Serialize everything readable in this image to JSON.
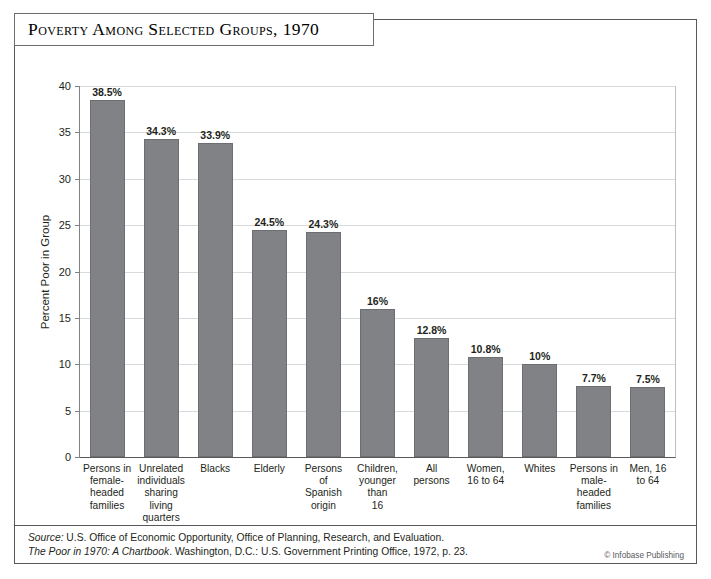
{
  "title": "Poverty Among Selected Groups, 1970",
  "footer": {
    "source_prefix": "Source:",
    "source_line1": " U.S. Office of Economic Opportunity, Office of Planning, Research, and Evaluation.",
    "source_italic_title": "The Poor in 1970: A Chartbook",
    "source_line2": ". Washington, D.C.: U.S. Government Printing Office, 1972, p. 23.",
    "credit": "© Infobase Publishing"
  },
  "colors": {
    "bar_fill": "#808285",
    "bar_edge": "#6d6e71",
    "gridline": "#d9dadb",
    "axis": "#58595b",
    "text": "#231f20",
    "frame": "#58595b"
  },
  "chart_data": {
    "type": "bar",
    "title": "Poverty Among Selected Groups, 1970",
    "xlabel": "",
    "ylabel": "Percent Poor in Group",
    "ylim": [
      0,
      40
    ],
    "yticks": [
      0,
      5,
      10,
      15,
      20,
      25,
      30,
      35,
      40
    ],
    "ytick_labels": [
      "0",
      "5",
      "10",
      "15",
      "20",
      "25",
      "30",
      "35",
      "40"
    ],
    "grid": true,
    "legend": false,
    "categories": [
      "Persons in female-headed families",
      "Unrelated individuals sharing living quarters",
      "Blacks",
      "Elderly",
      "Persons of Spanish origin",
      "Children, younger than 16",
      "All persons",
      "Women, 16 to 64",
      "Whites",
      "Persons in male-headed families",
      "Men, 16 to 64"
    ],
    "category_lines": [
      [
        "Persons in",
        "female-",
        "headed",
        "families"
      ],
      [
        "Unrelated",
        "individuals",
        "sharing",
        "living",
        "quarters"
      ],
      [
        "Blacks"
      ],
      [
        "Elderly"
      ],
      [
        "Persons",
        "of",
        "Spanish",
        "origin"
      ],
      [
        "Children,",
        "younger",
        "than",
        "16"
      ],
      [
        "All",
        "persons"
      ],
      [
        "Women,",
        "16 to 64"
      ],
      [
        "Whites"
      ],
      [
        "Persons in",
        "male-",
        "headed",
        "families"
      ],
      [
        "Men, 16",
        "to 64"
      ]
    ],
    "values": [
      38.5,
      34.3,
      33.9,
      24.5,
      24.3,
      16,
      12.8,
      10.8,
      10,
      7.7,
      7.5
    ],
    "value_labels": [
      "38.5%",
      "34.3%",
      "33.9%",
      "24.5%",
      "24.3%",
      "16%",
      "12.8%",
      "10.8%",
      "10%",
      "7.7%",
      "7.5%"
    ]
  }
}
